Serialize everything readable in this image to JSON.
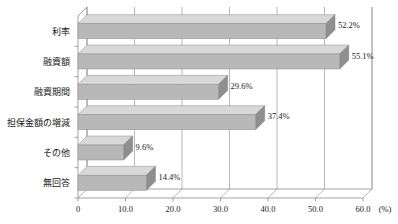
{
  "chart_data": {
    "type": "bar",
    "orientation": "horizontal",
    "title": "",
    "xlabel": "(%)",
    "ylabel": "",
    "categories": [
      "利率",
      "融資額",
      "融資期間",
      "担保金額の増減",
      "その他",
      "無回答"
    ],
    "values": [
      52.2,
      55.1,
      29.6,
      37.4,
      9.6,
      14.4
    ],
    "data_labels": [
      "52.2%",
      "55.1%",
      "29.6%",
      "37.4%",
      "9.6%",
      "14.4%"
    ],
    "xlim": [
      0,
      60
    ],
    "xticks": [
      0,
      10,
      20,
      30,
      40,
      50,
      60
    ],
    "xtick_labels": [
      "0",
      "10.0",
      "20.0",
      "30.0",
      "40.0",
      "50.0",
      "60.0"
    ],
    "unit_label": "(%)",
    "grid": true,
    "legend": null,
    "style": "3d",
    "colors": {
      "bar_front": "#b8b8b8",
      "bar_top": "#d8d8d8",
      "bar_side": "#8f8f8f",
      "grid": "#9a9a9a",
      "axis": "#8a8a8a",
      "text": "#1a1a1a",
      "background": "#ffffff"
    }
  }
}
